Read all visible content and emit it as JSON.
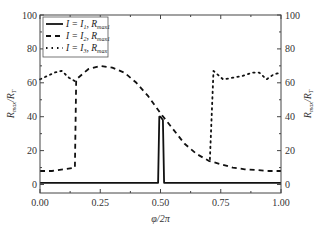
{
  "chart_data": {
    "type": "line",
    "title": "",
    "xlabel": "φ/2π",
    "ylabel": "R_max/R_T",
    "ylabel_right": "R_max/R_T",
    "xlim": [
      0.0,
      1.0
    ],
    "ylim": [
      -5,
      100
    ],
    "xticks": [
      "0.00",
      "0.25",
      "0.50",
      "0.75",
      "1.00"
    ],
    "yticks": [
      "0",
      "20",
      "40",
      "60",
      "80",
      "100"
    ],
    "yticks_right": [
      "0",
      "20",
      "40",
      "60",
      "80",
      "100"
    ],
    "grid": false,
    "legend_position": "upper left",
    "legend": [
      {
        "label": "I = I1, Rmax1",
        "style": "solid"
      },
      {
        "label": "I = I2, Rmax1",
        "style": "dashed"
      },
      {
        "label": "I = I3, Rmax",
        "style": "dotted"
      }
    ],
    "series": [
      {
        "name": "I = I1, Rmax1",
        "style": "solid",
        "x": [
          0.0,
          0.49,
          0.495,
          0.5,
          0.51,
          0.515,
          0.52,
          1.0
        ],
        "y": [
          1,
          1,
          40,
          40,
          38,
          1,
          1,
          1
        ]
      },
      {
        "name": "I = I2, Rmax1",
        "style": "dashed",
        "x": [
          0.0,
          0.05,
          0.1,
          0.145,
          0.15,
          0.2,
          0.25,
          0.3,
          0.35,
          0.4,
          0.45,
          0.5,
          0.55,
          0.6,
          0.65,
          0.7,
          0.75,
          0.8,
          0.85,
          0.9,
          0.95,
          1.0
        ],
        "y": [
          8,
          8,
          9,
          10,
          62,
          68,
          70,
          69,
          66,
          60,
          52,
          42,
          33,
          24,
          18,
          14,
          12,
          10,
          9,
          8.5,
          8,
          8
        ]
      },
      {
        "name": "I = I3, Rmax",
        "style": "dotted",
        "x": [
          0.0,
          0.03,
          0.06,
          0.09,
          0.12,
          0.145,
          0.15,
          0.7,
          0.705,
          0.72,
          0.76,
          0.8,
          0.84,
          0.88,
          0.91,
          0.94,
          0.97,
          1.0
        ],
        "y": [
          62,
          64,
          66,
          67,
          63,
          61,
          null,
          null,
          15,
          67,
          62,
          63,
          64,
          66,
          66,
          62,
          65,
          66
        ]
      }
    ]
  }
}
